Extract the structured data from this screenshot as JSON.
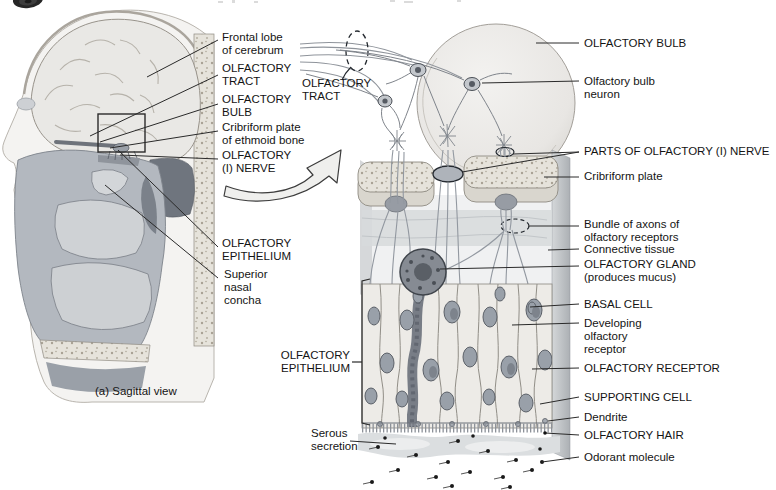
{
  "figure": {
    "header": {
      "icon": "disc-icon"
    },
    "palette": {
      "ink": "#141414",
      "leader_line": "#2a2a2a",
      "bulb_fill": "#eeedeb",
      "tissue_gray": "#b3b8bf",
      "concha_gray": "#d3d6d9",
      "bone_speckle": "#e6e3db",
      "gland_dark": "#868b93",
      "nucleus_gray": "#99a0a9",
      "background": "#ffffff"
    },
    "sagittal_view": {
      "labels": {
        "frontal_lobe": "Frontal lobe\nof cerebrum",
        "olfactory_tract": "OLFACTORY\nTRACT",
        "olfactory_bulb": "OLFACTORY\nBULB",
        "cribriform_plate": "Cribriform plate\nof ethmoid bone",
        "olfactory_nerve": "OLFACTORY\n(I) NERVE",
        "olfactory_epithelium": "OLFACTORY\nEPITHELIUM",
        "superior_nasal_concha": "Superior\nnasal\nconcha"
      },
      "caption": "(a) Sagittal view"
    },
    "enlarged_view": {
      "labels": {
        "olfactory_tract": "OLFACTORY\nTRACT",
        "olfactory_bulb": "OLFACTORY BULB",
        "olfactory_bulb_neuron": "Olfactory bulb\nneuron",
        "parts_of_olfactory_nerve": "PARTS OF OLFACTORY (I) NERVE",
        "cribriform_plate": "Cribriform plate",
        "bundle_of_axons": "Bundle of axons of\nolfactory receptors",
        "connective_tissue": "Connective tissue",
        "olfactory_gland": "OLFACTORY GLAND\n(produces mucus)",
        "basal_cell": "BASAL CELL",
        "developing_olfactory_receptor": "Developing\nolfactory\nreceptor",
        "olfactory_receptor": "OLFACTORY RECEPTOR",
        "supporting_cell": "SUPPORTING CELL",
        "dendrite": "Dendrite",
        "olfactory_hair": "OLFACTORY HAIR",
        "odorant_molecule": "Odorant molecule",
        "olfactory_epithelium": "OLFACTORY\nEPITHELIUM",
        "serous_secretion": "Serous\nsecretion"
      }
    }
  }
}
